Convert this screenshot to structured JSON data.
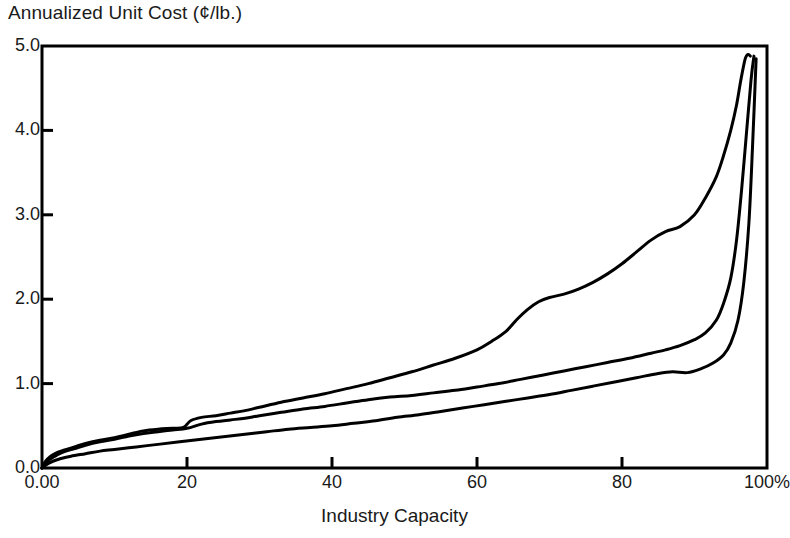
{
  "chart_data": {
    "type": "line",
    "title": "Annualized Unit Cost (¢/lb.)",
    "xlabel": "Industry Capacity",
    "ylabel": "Annualized Unit Cost (¢/lb.)",
    "grid": false,
    "legend": "none",
    "xlim": [
      0,
      100
    ],
    "ylim": [
      0.0,
      5.0
    ],
    "x_ticks": [
      0,
      20,
      40,
      60,
      80,
      100
    ],
    "x_tick_labels": [
      "0.00",
      "20",
      "40",
      "60",
      "80",
      "100%"
    ],
    "y_ticks": [
      0.0,
      1.0,
      2.0,
      3.0,
      4.0,
      5.0
    ],
    "y_tick_labels": [
      "0.0",
      "1.0",
      "2.0",
      "3.0",
      "4.0",
      "5.0"
    ],
    "line_color": "#000000",
    "line_width": 3,
    "background_color": "#ffffff",
    "series": [
      {
        "name": "upper-cost-curve",
        "x": [
          0.0,
          0.5,
          1.2,
          2.0,
          3.0,
          4.5,
          6.0,
          8.0,
          10.0,
          12.0,
          14.0,
          16.0,
          18.0,
          19.5,
          20.5,
          22.0,
          24.0,
          26.0,
          28.0,
          30.0,
          33.0,
          36.0,
          39.0,
          42.0,
          45.0,
          48.0,
          51.0,
          54.0,
          57.0,
          60.0,
          62.0,
          64.0,
          65.5,
          67.0,
          68.5,
          70.0,
          72.0,
          74.0,
          76.0,
          78.0,
          80.0,
          82.0,
          84.0,
          86.0,
          88.0,
          90.0,
          91.5,
          93.0,
          94.0,
          95.0,
          95.8,
          96.4,
          97.0,
          97.4,
          97.7
        ],
        "y": [
          0.0,
          0.08,
          0.14,
          0.18,
          0.21,
          0.25,
          0.29,
          0.33,
          0.36,
          0.4,
          0.44,
          0.46,
          0.47,
          0.48,
          0.56,
          0.6,
          0.62,
          0.65,
          0.68,
          0.72,
          0.78,
          0.83,
          0.88,
          0.94,
          1.0,
          1.07,
          1.14,
          1.22,
          1.3,
          1.4,
          1.5,
          1.62,
          1.76,
          1.88,
          1.97,
          2.02,
          2.06,
          2.12,
          2.2,
          2.3,
          2.42,
          2.56,
          2.7,
          2.8,
          2.86,
          3.0,
          3.2,
          3.45,
          3.7,
          4.0,
          4.3,
          4.6,
          4.85,
          4.9,
          4.88
        ]
      },
      {
        "name": "middle-cost-curve",
        "x": [
          0.0,
          0.5,
          1.2,
          2.0,
          3.0,
          4.5,
          6.0,
          8.0,
          10.0,
          12.0,
          14.0,
          16.0,
          18.0,
          20.0,
          22.0,
          24.0,
          26.0,
          28.0,
          30.0,
          33.0,
          36.0,
          39.0,
          42.0,
          45.0,
          48.0,
          51.0,
          54.0,
          57.0,
          60.0,
          63.0,
          66.0,
          69.0,
          72.0,
          75.0,
          78.0,
          81.0,
          84.0,
          86.0,
          88.0,
          90.0,
          91.5,
          93.0,
          94.0,
          95.0,
          95.8,
          96.5,
          97.2,
          97.8,
          98.2
        ],
        "y": [
          0.0,
          0.06,
          0.11,
          0.15,
          0.19,
          0.23,
          0.27,
          0.31,
          0.34,
          0.38,
          0.41,
          0.43,
          0.45,
          0.47,
          0.52,
          0.55,
          0.57,
          0.59,
          0.62,
          0.66,
          0.7,
          0.73,
          0.77,
          0.81,
          0.84,
          0.86,
          0.89,
          0.92,
          0.96,
          1.0,
          1.05,
          1.1,
          1.15,
          1.2,
          1.25,
          1.3,
          1.36,
          1.4,
          1.45,
          1.52,
          1.6,
          1.75,
          1.95,
          2.25,
          2.7,
          3.3,
          4.0,
          4.6,
          4.88
        ]
      },
      {
        "name": "lower-cost-curve",
        "x": [
          0.0,
          0.6,
          1.5,
          2.5,
          4.0,
          6.0,
          8.0,
          10.0,
          13.0,
          16.0,
          19.0,
          22.0,
          25.0,
          28.0,
          31.0,
          34.0,
          37.0,
          40.0,
          43.0,
          46.0,
          49.0,
          52.0,
          55.0,
          58.0,
          61.0,
          64.0,
          67.0,
          70.0,
          73.0,
          76.0,
          79.0,
          82.0,
          85.0,
          87.0,
          89.0,
          91.0,
          92.5,
          94.0,
          95.0,
          96.0,
          96.8,
          97.5,
          98.0,
          98.5
        ],
        "y": [
          0.0,
          0.04,
          0.08,
          0.11,
          0.14,
          0.17,
          0.2,
          0.22,
          0.25,
          0.28,
          0.31,
          0.34,
          0.37,
          0.4,
          0.43,
          0.46,
          0.48,
          0.5,
          0.53,
          0.56,
          0.6,
          0.63,
          0.67,
          0.71,
          0.75,
          0.79,
          0.83,
          0.87,
          0.92,
          0.97,
          1.02,
          1.07,
          1.12,
          1.14,
          1.13,
          1.18,
          1.24,
          1.34,
          1.48,
          1.75,
          2.2,
          2.9,
          3.8,
          4.85
        ]
      }
    ]
  },
  "axes": {
    "frame_color": "#000000",
    "tick_direction": "in"
  }
}
